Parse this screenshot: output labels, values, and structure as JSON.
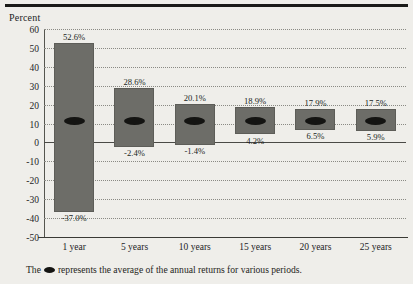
{
  "chart": {
    "axis_title": "Percent",
    "caption_before": "The",
    "caption_after": "represents the average of the annual returns for various periods.",
    "marker_icon": "ellipse-marker-icon"
  },
  "chart_data": {
    "type": "bar",
    "title": "",
    "subtitle": "",
    "xlabel": "",
    "ylabel": "Percent",
    "ylim": [
      -50,
      60
    ],
    "ytick_step": 10,
    "yticks": [
      60,
      50,
      40,
      30,
      20,
      10,
      0,
      -10,
      -20,
      -30,
      -40,
      -50
    ],
    "ytick_labels": [
      "60",
      "50",
      "40",
      "30",
      "20",
      "10",
      "0",
      "-10",
      "-20",
      "-30",
      "-40",
      "-50"
    ],
    "grid": true,
    "grid_style": "dotted-horizontal",
    "legend": "none",
    "zero_line": true,
    "categories": [
      "1 year",
      "5 years",
      "10 years",
      "15 years",
      "20 years",
      "25 years"
    ],
    "series": [
      {
        "name": "Highest annual return",
        "values": [
          52.6,
          28.6,
          20.1,
          18.9,
          17.9,
          17.5
        ],
        "labels": [
          "52.6%",
          "28.6%",
          "20.1%",
          "18.9%",
          "17.9%",
          "17.5%"
        ]
      },
      {
        "name": "Lowest annual return",
        "values": [
          -37.0,
          -2.4,
          -1.4,
          4.2,
          6.5,
          5.9
        ],
        "labels": [
          "-37.0%",
          "-2.4%",
          "-1.4%",
          "4.2%",
          "6.5%",
          "5.9%"
        ]
      },
      {
        "name": "Average of annual returns",
        "values": [
          11.5,
          11.5,
          11.5,
          11.5,
          11.5,
          11.5
        ],
        "labels": [
          "",
          "",
          "",
          "",
          "",
          ""
        ]
      }
    ],
    "bar_color": "#6d6d68",
    "marker_color": "#141412",
    "background_color": "#efeeea",
    "annotation": "The ● represents the average of the annual returns for various periods."
  }
}
